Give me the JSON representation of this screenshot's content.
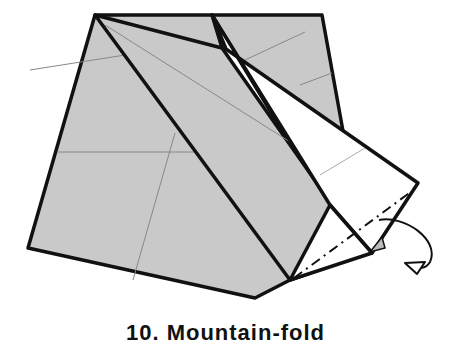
{
  "diagram": {
    "type": "origami-step",
    "colors": {
      "paper_colored": "#c9c9c9",
      "paper_white": "#ffffff",
      "edge": "#111111",
      "crease": "#888888",
      "background": "#ffffff"
    },
    "annotations": {
      "fold_line": "mountain-fold (dash-dot)",
      "arrow": "curved arrow indicating fold behind"
    },
    "caption": "10. Mountain-fold"
  }
}
